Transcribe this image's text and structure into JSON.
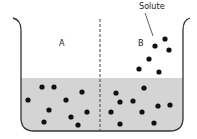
{
  "labels": {
    "side_a": "A",
    "side_b": "B",
    "solute": "Solute"
  },
  "colors": {
    "liquid": "#d4d4d4",
    "outline": "#333333",
    "dot": "#111111"
  },
  "particles": {
    "a_in_liquid": [
      [
        28,
        100
      ],
      [
        42,
        87
      ],
      [
        54,
        87
      ],
      [
        49,
        110
      ],
      [
        66,
        100
      ],
      [
        82,
        92
      ],
      [
        87,
        112
      ],
      [
        71,
        117
      ],
      [
        44,
        122
      ],
      [
        78,
        125
      ]
    ],
    "b_in_liquid": [
      [
        116,
        93
      ],
      [
        120,
        102
      ],
      [
        133,
        101
      ],
      [
        111,
        112
      ],
      [
        144,
        88
      ],
      [
        142,
        112
      ],
      [
        158,
        106
      ],
      [
        170,
        105
      ],
      [
        120,
        124
      ],
      [
        154,
        123
      ]
    ],
    "b_above_liquid": [
      [
        155,
        46
      ],
      [
        165,
        39
      ],
      [
        169,
        50
      ],
      [
        149,
        59
      ],
      [
        139,
        69
      ],
      [
        159,
        72
      ]
    ]
  }
}
